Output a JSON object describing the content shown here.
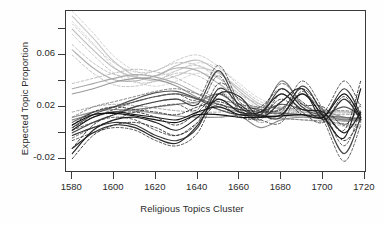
{
  "chart_data": {
    "type": "line",
    "title": "",
    "xlabel": "Religious Topics Cluster",
    "ylabel": "Expected Topic Proportion",
    "xlim": [
      1577,
      1721
    ],
    "ylim": [
      -0.031,
      0.094
    ],
    "xticks": [
      1580,
      1600,
      1620,
      1640,
      1660,
      1680,
      1700,
      1720
    ],
    "xticklabels": [
      "1580",
      "1600",
      "1620",
      "1640",
      "1660",
      "1680",
      "1700",
      "1720"
    ],
    "yticks": [
      -0.02,
      0.0,
      0.02,
      0.04,
      0.06,
      0.08
    ],
    "yticklabels": [
      "-0.02",
      "",
      "0.02",
      "",
      "0.06",
      ""
    ],
    "ylabeled_ticks": [
      "-0.02",
      "0.02",
      "0.06"
    ],
    "grid": false,
    "legend": false,
    "frame": true,
    "style_note": "grayscale smoothed topic-prevalence curves with dashed confidence bands",
    "x": [
      1580,
      1590,
      1600,
      1610,
      1620,
      1630,
      1640,
      1650,
      1660,
      1670,
      1680,
      1690,
      1700,
      1710,
      1718
    ],
    "series": [
      {
        "name": "topic-1",
        "shade": "#c9c9c9",
        "dash": false,
        "values": [
          0.09,
          0.073,
          0.055,
          0.044,
          0.04,
          0.044,
          0.05,
          0.046,
          0.034,
          0.022,
          0.018,
          0.016,
          0.014,
          0.012,
          0.011
        ]
      },
      {
        "name": "topic-1-upper",
        "shade": "#cfcfcf",
        "dash": true,
        "values": [
          0.094,
          0.077,
          0.059,
          0.048,
          0.044,
          0.048,
          0.054,
          0.05,
          0.038,
          0.026,
          0.022,
          0.02,
          0.018,
          0.017,
          0.016
        ]
      },
      {
        "name": "topic-1-lower",
        "shade": "#cfcfcf",
        "dash": true,
        "values": [
          0.086,
          0.069,
          0.051,
          0.04,
          0.036,
          0.04,
          0.046,
          0.042,
          0.03,
          0.018,
          0.014,
          0.012,
          0.01,
          0.007,
          0.006
        ]
      },
      {
        "name": "topic-2",
        "shade": "#bdbdbd",
        "dash": false,
        "values": [
          0.08,
          0.064,
          0.05,
          0.043,
          0.044,
          0.052,
          0.056,
          0.047,
          0.032,
          0.02,
          0.016,
          0.014,
          0.012,
          0.01,
          0.009
        ]
      },
      {
        "name": "topic-2-upper",
        "shade": "#c5c5c5",
        "dash": true,
        "values": [
          0.084,
          0.068,
          0.054,
          0.047,
          0.048,
          0.056,
          0.06,
          0.051,
          0.036,
          0.024,
          0.02,
          0.018,
          0.016,
          0.015,
          0.014
        ]
      },
      {
        "name": "topic-2-lower",
        "shade": "#c5c5c5",
        "dash": true,
        "values": [
          0.076,
          0.06,
          0.046,
          0.039,
          0.04,
          0.048,
          0.052,
          0.043,
          0.028,
          0.016,
          0.012,
          0.01,
          0.008,
          0.005,
          0.004
        ]
      },
      {
        "name": "topic-3",
        "shade": "#b2b2b2",
        "dash": false,
        "values": [
          0.064,
          0.05,
          0.041,
          0.04,
          0.044,
          0.05,
          0.048,
          0.038,
          0.026,
          0.018,
          0.015,
          0.014,
          0.013,
          0.011,
          0.01
        ]
      },
      {
        "name": "topic-3-upper",
        "shade": "#bbbbbb",
        "dash": true,
        "values": [
          0.068,
          0.054,
          0.045,
          0.044,
          0.048,
          0.054,
          0.052,
          0.042,
          0.03,
          0.022,
          0.019,
          0.018,
          0.017,
          0.016,
          0.015
        ]
      },
      {
        "name": "topic-3-lower",
        "shade": "#bbbbbb",
        "dash": true,
        "values": [
          0.06,
          0.046,
          0.037,
          0.036,
          0.04,
          0.046,
          0.044,
          0.034,
          0.022,
          0.014,
          0.011,
          0.01,
          0.009,
          0.006,
          0.005
        ]
      },
      {
        "name": "topic-4",
        "shade": "#a8a8a8",
        "dash": false,
        "values": [
          0.034,
          0.038,
          0.042,
          0.045,
          0.043,
          0.038,
          0.03,
          0.022,
          0.018,
          0.014,
          0.013,
          0.013,
          0.012,
          0.011,
          0.01
        ]
      },
      {
        "name": "topic-4-band",
        "shade": "#b4b4b4",
        "dash": true,
        "values": [
          0.038,
          0.042,
          0.046,
          0.049,
          0.047,
          0.042,
          0.034,
          0.026,
          0.022,
          0.018,
          0.017,
          0.017,
          0.016,
          0.016,
          0.015
        ]
      },
      {
        "name": "topic-5",
        "shade": "#9a9a9a",
        "dash": false,
        "values": [
          0.03,
          0.034,
          0.039,
          0.042,
          0.041,
          0.036,
          0.027,
          0.02,
          0.016,
          0.013,
          0.019,
          0.03,
          0.018,
          0.012,
          0.01
        ]
      },
      {
        "name": "topic-6",
        "shade": "#8e8e8e",
        "dash": false,
        "values": [
          0.012,
          0.016,
          0.018,
          0.017,
          0.015,
          0.013,
          0.012,
          0.012,
          0.013,
          0.004,
          0.01,
          0.012,
          0.011,
          0.009,
          0.01
        ]
      },
      {
        "name": "topic-6-band",
        "shade": "#9c9c9c",
        "dash": true,
        "values": [
          0.016,
          0.02,
          0.022,
          0.021,
          0.019,
          0.017,
          0.016,
          0.016,
          0.017,
          0.008,
          0.014,
          0.016,
          0.015,
          0.014,
          0.015
        ]
      },
      {
        "name": "topic-7",
        "shade": "#7d7d7d",
        "dash": false,
        "values": [
          0.01,
          0.014,
          0.016,
          0.018,
          0.02,
          0.022,
          0.024,
          0.03,
          0.02,
          0.014,
          0.04,
          0.022,
          0.014,
          0.01,
          0.012
        ]
      },
      {
        "name": "topic-8",
        "shade": "#6a6a6a",
        "dash": false,
        "values": [
          0.008,
          0.016,
          0.02,
          0.024,
          0.028,
          0.03,
          0.026,
          0.022,
          0.018,
          0.016,
          0.015,
          0.014,
          0.013,
          0.012,
          0.011
        ]
      },
      {
        "name": "topic-8-upper",
        "shade": "#767676",
        "dash": true,
        "values": [
          0.012,
          0.02,
          0.024,
          0.028,
          0.032,
          0.034,
          0.03,
          0.026,
          0.022,
          0.02,
          0.019,
          0.018,
          0.017,
          0.017,
          0.016
        ]
      },
      {
        "name": "topic-8-lower",
        "shade": "#767676",
        "dash": true,
        "values": [
          0.004,
          0.012,
          0.016,
          0.02,
          0.024,
          0.026,
          0.022,
          0.018,
          0.014,
          0.012,
          0.011,
          0.01,
          0.009,
          0.007,
          0.006
        ]
      },
      {
        "name": "topic-9",
        "shade": "#555555",
        "dash": false,
        "values": [
          0.004,
          0.014,
          0.02,
          0.026,
          0.031,
          0.032,
          0.026,
          0.018,
          0.014,
          0.016,
          0.022,
          0.018,
          0.014,
          0.02,
          0.013
        ]
      },
      {
        "name": "topic-10",
        "shade": "#454545",
        "dash": false,
        "values": [
          0.0,
          0.008,
          0.014,
          0.02,
          0.024,
          0.026,
          0.022,
          0.048,
          0.02,
          0.014,
          0.012,
          0.036,
          0.014,
          -0.016,
          0.012
        ]
      },
      {
        "name": "topic-10-upper",
        "shade": "#505050",
        "dash": true,
        "values": [
          0.004,
          0.012,
          0.018,
          0.024,
          0.028,
          0.03,
          0.026,
          0.052,
          0.024,
          0.018,
          0.016,
          0.04,
          0.018,
          -0.01,
          0.018
        ]
      },
      {
        "name": "topic-10-lower",
        "shade": "#505050",
        "dash": true,
        "values": [
          -0.004,
          0.004,
          0.01,
          0.016,
          0.02,
          0.022,
          0.018,
          0.044,
          0.016,
          0.01,
          0.008,
          0.032,
          0.01,
          -0.022,
          0.006
        ]
      },
      {
        "name": "topic-11",
        "shade": "#3a3a3a",
        "dash": false,
        "values": [
          -0.002,
          0.004,
          0.008,
          0.006,
          -0.002,
          -0.006,
          0.004,
          0.034,
          0.022,
          0.014,
          0.034,
          0.02,
          0.012,
          0.034,
          0.014
        ]
      },
      {
        "name": "topic-11-upper",
        "shade": "#444444",
        "dash": true,
        "values": [
          0.002,
          0.008,
          0.012,
          0.01,
          0.002,
          -0.002,
          0.008,
          0.038,
          0.026,
          0.018,
          0.038,
          0.024,
          0.016,
          0.04,
          0.02
        ]
      },
      {
        "name": "topic-11-lower",
        "shade": "#444444",
        "dash": true,
        "values": [
          -0.006,
          0.0,
          0.004,
          0.002,
          -0.006,
          -0.01,
          0.0,
          0.03,
          0.018,
          0.01,
          0.03,
          0.016,
          0.008,
          0.028,
          0.008
        ]
      },
      {
        "name": "topic-12",
        "shade": "#2b2b2b",
        "dash": false,
        "values": [
          -0.012,
          0.0,
          0.006,
          0.004,
          -0.004,
          -0.008,
          0.006,
          0.03,
          0.028,
          0.012,
          0.024,
          0.034,
          0.01,
          0.026,
          0.01
        ]
      },
      {
        "name": "topic-13",
        "shade": "#222222",
        "dash": false,
        "values": [
          -0.016,
          0.002,
          0.01,
          0.012,
          0.008,
          0.002,
          0.012,
          0.026,
          0.016,
          0.016,
          0.03,
          0.018,
          0.016,
          0.0,
          0.016
        ]
      },
      {
        "name": "topic-13-upper",
        "shade": "#2e2e2e",
        "dash": true,
        "values": [
          -0.012,
          0.006,
          0.014,
          0.016,
          0.012,
          0.006,
          0.016,
          0.03,
          0.02,
          0.02,
          0.034,
          0.022,
          0.02,
          0.006,
          0.022
        ]
      },
      {
        "name": "topic-13-lower",
        "shade": "#2e2e2e",
        "dash": true,
        "values": [
          -0.02,
          -0.002,
          0.006,
          0.008,
          0.004,
          -0.002,
          0.008,
          0.022,
          0.012,
          0.012,
          0.026,
          0.014,
          0.012,
          -0.006,
          0.01
        ]
      },
      {
        "name": "topic-14",
        "shade": "#1a1a1a",
        "dash": false,
        "values": [
          0.002,
          0.012,
          0.016,
          0.014,
          0.012,
          0.01,
          0.016,
          0.02,
          0.014,
          0.013,
          0.014,
          0.03,
          0.013,
          -0.004,
          0.034
        ]
      },
      {
        "name": "topic-14-band",
        "shade": "#262626",
        "dash": true,
        "values": [
          0.006,
          0.016,
          0.02,
          0.018,
          0.016,
          0.014,
          0.02,
          0.024,
          0.018,
          0.017,
          0.018,
          0.034,
          0.017,
          0.002,
          0.04
        ]
      },
      {
        "name": "topic-15",
        "shade": "#111111",
        "dash": false,
        "values": [
          0.006,
          0.014,
          0.015,
          0.013,
          0.01,
          0.008,
          0.014,
          0.014,
          0.012,
          0.012,
          0.013,
          0.014,
          0.012,
          0.03,
          0.012
        ]
      }
    ]
  },
  "axis": {
    "ylabel_text": "Expected Topic Proportion",
    "xlabel_text": "Religious Topics Cluster"
  }
}
